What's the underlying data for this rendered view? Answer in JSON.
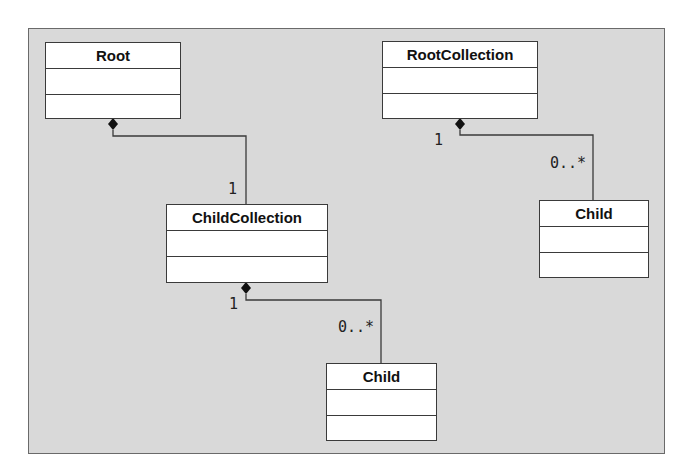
{
  "diagram": {
    "type": "UML class diagram",
    "classes": [
      {
        "id": "root",
        "name": "Root"
      },
      {
        "id": "child-collection",
        "name": "ChildCollection"
      },
      {
        "id": "child-1",
        "name": "Child"
      },
      {
        "id": "root-collection",
        "name": "RootCollection"
      },
      {
        "id": "child-2",
        "name": "Child"
      }
    ],
    "associations": [
      {
        "from": "Root",
        "to": "ChildCollection",
        "kind": "composition",
        "from_mult": "",
        "to_mult": "1"
      },
      {
        "from": "ChildCollection",
        "to": "Child",
        "kind": "composition",
        "from_mult": "1",
        "to_mult": "0..*"
      },
      {
        "from": "RootCollection",
        "to": "Child",
        "kind": "composition",
        "from_mult": "1",
        "to_mult": "0..*"
      }
    ],
    "labels": {
      "root_cc_to": "1",
      "cc_child_from": "1",
      "cc_child_to": "0..*",
      "rc_child_from": "1",
      "rc_child_to": "0..*"
    },
    "colors": {
      "background": "#d9d9d9",
      "box": "#ffffff",
      "line": "#3a3a3a"
    }
  }
}
